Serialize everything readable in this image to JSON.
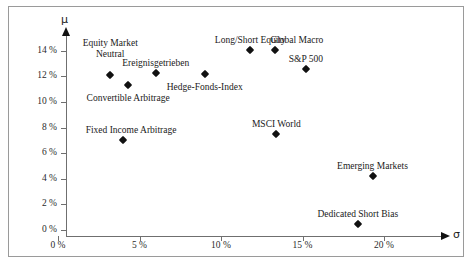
{
  "chart_data": {
    "type": "scatter",
    "title": "",
    "xlabel": "σ",
    "ylabel": "μ",
    "xlim": [
      0,
      23
    ],
    "ylim": [
      0,
      15.5
    ],
    "grid": false,
    "legend": "none",
    "x_tick_labels": [
      "0 %",
      "5 %",
      "10 %",
      "15 %",
      "20 %"
    ],
    "x_tick_values": [
      0,
      5,
      10,
      15,
      20
    ],
    "y_tick_labels": [
      "0 %",
      "2 %",
      "4 %",
      "6 %",
      "8 %",
      "10 %",
      "12 %",
      "14 %"
    ],
    "y_tick_values": [
      0,
      2,
      4,
      6,
      8,
      10,
      12,
      14
    ],
    "points": [
      {
        "label": "Equity Market\nNeutral",
        "label_line1": "Equity Market",
        "label_line2": "Neutral",
        "x": 3.2,
        "y": 12.1,
        "label_align": "center",
        "label_dx": 0,
        "label_dy": -26
      },
      {
        "label": "Convertible Arbitrage",
        "label_line1": "Convertible Arbitrage",
        "label_line2": "",
        "x": 4.3,
        "y": 11.3,
        "label_align": "center",
        "label_dx": 0,
        "label_dy": 8
      },
      {
        "label": "Ereignisgetrieben",
        "label_line1": "Ereignisgetrieben",
        "label_line2": "",
        "x": 6.0,
        "y": 12.3,
        "label_align": "center",
        "label_dx": 0,
        "label_dy": -15
      },
      {
        "label": "Hedge-Fonds-Index",
        "label_line1": "Hedge-Fonds-Index",
        "label_line2": "",
        "x": 9.0,
        "y": 12.2,
        "label_align": "center",
        "label_dx": 0,
        "label_dy": 8
      },
      {
        "label": "Long/Short Equity",
        "label_line1": "Long/Short Equity",
        "label_line2": "",
        "x": 11.8,
        "y": 14.1,
        "label_align": "center",
        "label_dx": 0,
        "label_dy": -15
      },
      {
        "label": "Global Macro",
        "label_line1": "Global Macro",
        "label_line2": "",
        "x": 13.3,
        "y": 14.1,
        "label_align": "center",
        "label_dx": 22,
        "label_dy": -15
      },
      {
        "label": "S&P 500",
        "label_line1": "S&P 500",
        "label_line2": "",
        "x": 15.2,
        "y": 12.6,
        "label_align": "center",
        "label_dx": 0,
        "label_dy": -15
      },
      {
        "label": "Fixed Income Arbitrage",
        "label_line1": "Fixed Income Arbitrage",
        "label_line2": "",
        "x": 4.0,
        "y": 7.0,
        "label_align": "center",
        "label_dx": 8,
        "label_dy": -15
      },
      {
        "label": "MSCI World",
        "label_line1": "MSCI World",
        "label_line2": "",
        "x": 13.4,
        "y": 7.5,
        "label_align": "center",
        "label_dx": 0,
        "label_dy": -15
      },
      {
        "label": "Emerging Markets",
        "label_line1": "Emerging Markets",
        "label_line2": "",
        "x": 19.3,
        "y": 4.2,
        "label_align": "center",
        "label_dx": 0,
        "label_dy": -15
      },
      {
        "label": "Dedicated Short Bias",
        "label_line1": "Dedicated Short Bias",
        "label_line2": "",
        "x": 18.4,
        "y": 0.5,
        "label_align": "center",
        "label_dx": 0,
        "label_dy": -15
      }
    ]
  },
  "caption": {
    "text": ""
  }
}
